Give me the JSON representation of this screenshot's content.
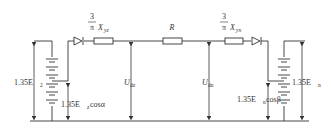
{
  "diagram": {
    "type": "circuit",
    "stroke_color": "#333333",
    "background": "#ffffff",
    "left_source": {
      "voltage_label": "1.35E",
      "voltage_sub": "2",
      "controlled_label": "1.35E",
      "controlled_sub": "z",
      "controlled_suffix": "cosα"
    },
    "left_reactance": {
      "numerator": "3",
      "denominator": "π",
      "symbol": "X",
      "sub": "yz"
    },
    "resistor": {
      "label": "R"
    },
    "right_reactance": {
      "numerator": "3",
      "denominator": "π",
      "symbol": "X",
      "sub": "yn"
    },
    "right_source": {
      "voltage_label": "1.35E",
      "voltage_sub": "n",
      "controlled_label": "1.35E",
      "controlled_sub": "n",
      "controlled_suffix": "cosβ"
    },
    "voltages": {
      "left": {
        "symbol": "U",
        "sub": "dz"
      },
      "right": {
        "symbol": "U",
        "sub": "dn"
      }
    },
    "icons": [
      "diode-icon",
      "resistor-icon",
      "battery-icon",
      "arrow-icon"
    ]
  }
}
